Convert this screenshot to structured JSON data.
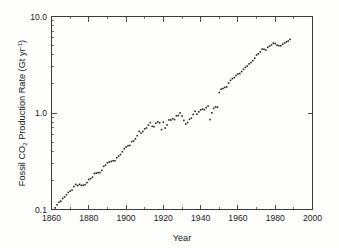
{
  "figure": {
    "background_color": "#fdfdfb",
    "ink_color": "#262626"
  },
  "axes": {
    "x_label": "Year",
    "y_label_parts": {
      "pre": "Fossil CO",
      "sub": "2",
      "mid": " Production Rate (Gt yr",
      "sup": "-1",
      "post": ")"
    },
    "y_label_plain": "Fossil CO2 Production Rate (Gt yr-1)",
    "x_ticks": [
      "1860",
      "1880",
      "1900",
      "1920",
      "1940",
      "1960",
      "1980",
      "2000"
    ],
    "y_ticks": [
      "0.1",
      "1.0",
      "10.0"
    ]
  },
  "chart_data": {
    "type": "scatter",
    "title": "",
    "subtitle": "",
    "xlabel": "Year",
    "ylabel": "Fossil CO2 Production Rate (Gt yr-1)",
    "xlim": [
      1860,
      2000
    ],
    "ylim": [
      0.1,
      10.0
    ],
    "yscale": "log",
    "xscale": "linear",
    "grid": false,
    "legend": null,
    "x_major_ticks": [
      1860,
      1880,
      1900,
      1920,
      1940,
      1960,
      1980,
      2000
    ],
    "x_minor_ticks": [
      1870,
      1890,
      1910,
      1930,
      1950,
      1970,
      1990
    ],
    "y_major_ticks": [
      0.1,
      1.0,
      10.0
    ],
    "y_minor_ticks": [
      0.2,
      0.3,
      0.4,
      0.5,
      0.6,
      0.7,
      0.8,
      0.9,
      2,
      3,
      4,
      5,
      6,
      7,
      8,
      9
    ],
    "marker": "square",
    "marker_size_px": 1.6,
    "series": [
      {
        "name": "Fossil CO2 production rate",
        "x": [
          1860,
          1861,
          1862,
          1863,
          1864,
          1865,
          1866,
          1867,
          1868,
          1869,
          1870,
          1871,
          1872,
          1873,
          1874,
          1875,
          1876,
          1877,
          1878,
          1879,
          1880,
          1881,
          1882,
          1883,
          1884,
          1885,
          1886,
          1887,
          1888,
          1889,
          1890,
          1891,
          1892,
          1893,
          1894,
          1895,
          1896,
          1897,
          1898,
          1899,
          1900,
          1901,
          1902,
          1903,
          1904,
          1905,
          1906,
          1907,
          1908,
          1909,
          1910,
          1911,
          1912,
          1913,
          1914,
          1915,
          1916,
          1917,
          1918,
          1919,
          1920,
          1921,
          1922,
          1923,
          1924,
          1925,
          1926,
          1927,
          1928,
          1929,
          1930,
          1931,
          1932,
          1933,
          1934,
          1935,
          1936,
          1937,
          1938,
          1939,
          1940,
          1941,
          1942,
          1943,
          1944,
          1945,
          1946,
          1947,
          1948,
          1949,
          1950,
          1951,
          1952,
          1953,
          1954,
          1955,
          1956,
          1957,
          1958,
          1959,
          1960,
          1961,
          1962,
          1963,
          1964,
          1965,
          1966,
          1967,
          1968,
          1969,
          1970,
          1971,
          1972,
          1973,
          1974,
          1975,
          1976,
          1977,
          1978,
          1979,
          1980,
          1981,
          1982,
          1983,
          1984,
          1985,
          1986,
          1987,
          1988
        ],
        "y": [
          0.091,
          0.097,
          0.104,
          0.112,
          0.119,
          0.122,
          0.13,
          0.135,
          0.142,
          0.15,
          0.155,
          0.159,
          0.173,
          0.182,
          0.177,
          0.182,
          0.178,
          0.178,
          0.181,
          0.19,
          0.205,
          0.209,
          0.216,
          0.236,
          0.238,
          0.241,
          0.241,
          0.254,
          0.28,
          0.288,
          0.305,
          0.311,
          0.315,
          0.32,
          0.32,
          0.344,
          0.358,
          0.371,
          0.397,
          0.427,
          0.444,
          0.457,
          0.461,
          0.505,
          0.513,
          0.54,
          0.582,
          0.646,
          0.618,
          0.643,
          0.684,
          0.7,
          0.75,
          0.795,
          0.728,
          0.722,
          0.783,
          0.81,
          0.791,
          0.673,
          0.803,
          0.698,
          0.752,
          0.848,
          0.846,
          0.873,
          0.854,
          0.934,
          0.942,
          1.001,
          0.93,
          0.838,
          0.768,
          0.797,
          0.86,
          0.885,
          0.966,
          1.043,
          0.972,
          1.028,
          1.076,
          1.098,
          1.08,
          1.137,
          1.18,
          0.855,
          1.004,
          1.118,
          1.159,
          1.146,
          1.63,
          1.767,
          1.795,
          1.841,
          1.865,
          2.043,
          2.179,
          2.27,
          2.33,
          2.45,
          2.535,
          2.564,
          2.688,
          2.84,
          2.973,
          3.065,
          3.226,
          3.334,
          3.489,
          3.699,
          3.998,
          4.107,
          4.307,
          4.585,
          4.575,
          4.498,
          4.792,
          4.935,
          5.079,
          5.297,
          5.24,
          5.049,
          4.985,
          4.975,
          5.152,
          5.299,
          5.459,
          5.563,
          5.795
        ]
      }
    ]
  }
}
